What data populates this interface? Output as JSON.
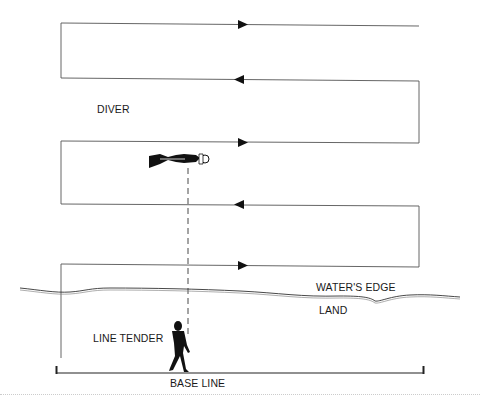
{
  "diagram": {
    "type": "search-pattern",
    "labels": {
      "diver": "DIVER",
      "waters_edge": "WATER'S EDGE",
      "land": "LAND",
      "line_tender": "LINE TENDER",
      "base_line": "BASE LINE"
    },
    "icons": [
      "diver-figure-icon",
      "line-tender-figure-icon",
      "arrow-right-icon",
      "arrow-left-icon"
    ],
    "lanes": [
      {
        "y": 24,
        "direction": "right"
      },
      {
        "y": 80,
        "direction": "left"
      },
      {
        "y": 142,
        "direction": "right"
      },
      {
        "y": 205,
        "direction": "left"
      },
      {
        "y": 266,
        "direction": "right"
      }
    ],
    "caption": ""
  }
}
